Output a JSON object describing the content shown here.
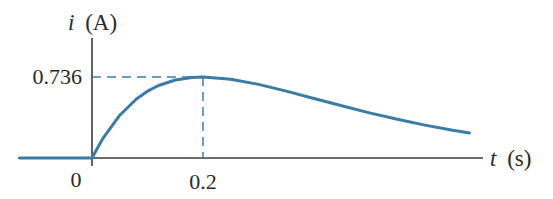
{
  "chart_data": {
    "type": "line",
    "title": "",
    "xlabel": "t (s)",
    "ylabel": "i (A)",
    "xlabel_var": "t",
    "xlabel_unit": "(s)",
    "ylabel_var": "i",
    "ylabel_unit": "(A)",
    "x_ticks": [
      {
        "value": 0,
        "label": "0"
      },
      {
        "value": 0.2,
        "label": "0.2"
      }
    ],
    "y_ticks": [
      {
        "value": 0.736,
        "label": "0.736"
      }
    ],
    "annotations": [
      {
        "type": "dashed-guide",
        "from": [
          0,
          0.736
        ],
        "to": [
          0.2,
          0.736
        ]
      },
      {
        "type": "dashed-guide",
        "from": [
          0.2,
          0
        ],
        "to": [
          0.2,
          0.736
        ]
      }
    ],
    "series": [
      {
        "name": "i(t)",
        "color": "#3a7ca5",
        "description": "Zero for t<0, rises to peak 0.736 A at t=0.2 s, then decays toward zero",
        "x": [
          -0.13,
          0,
          0.02,
          0.05,
          0.08,
          0.1,
          0.12,
          0.15,
          0.18,
          0.2,
          0.25,
          0.3,
          0.35,
          0.4,
          0.45,
          0.5,
          0.55,
          0.6,
          0.65,
          0.68
        ],
        "y": [
          0,
          0,
          0.181,
          0.389,
          0.536,
          0.607,
          0.659,
          0.709,
          0.732,
          0.736,
          0.716,
          0.669,
          0.608,
          0.541,
          0.474,
          0.41,
          0.352,
          0.299,
          0.252,
          0.227
        ]
      }
    ],
    "xlim": [
      -0.13,
      0.7
    ],
    "ylim": [
      0,
      0.95
    ],
    "grid": false,
    "legend": "none"
  },
  "labels": {
    "y_axis_var": "i",
    "y_axis_unit": "(A)",
    "x_axis_var": "t",
    "x_axis_unit": "(s)",
    "y_tick_peak": "0.736",
    "x_tick_zero": "0",
    "x_tick_peak": "0.2"
  },
  "colors": {
    "curve": "#3a7ca5",
    "axis": "#3c3c3c",
    "guide": "#3a7ca5",
    "text": "#2a2a2a"
  }
}
